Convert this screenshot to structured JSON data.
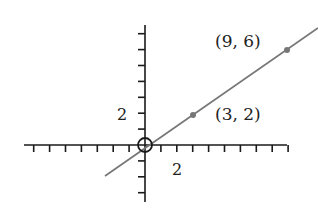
{
  "chart_data": {
    "type": "line",
    "title": "",
    "xlabel": "",
    "ylabel": "",
    "xlim": [
      -7,
      9
    ],
    "ylim": [
      -3,
      7
    ],
    "grid": false,
    "x_tick_label": "2",
    "y_tick_label": "2",
    "series": [
      {
        "name": "y = (2/3)x",
        "slope": 0.6667,
        "intercept": 0,
        "x_range": [
          -2.5,
          10.7
        ]
      }
    ],
    "points": [
      {
        "x": 0,
        "y": 0,
        "label": "",
        "marker": "open-circle"
      },
      {
        "x": 3,
        "y": 2,
        "label": "(3, 2)",
        "marker": "dot"
      },
      {
        "x": 9,
        "y": 6,
        "label": "(9, 6)",
        "marker": "dot"
      }
    ],
    "colors": {
      "axis": "#1a1a1a",
      "line": "#777777",
      "point": "#777777",
      "text": "#222222"
    }
  },
  "labels": {
    "point_a": "(3, 2)",
    "point_b": "(9, 6)",
    "x_tick": "2",
    "y_tick": "2"
  }
}
